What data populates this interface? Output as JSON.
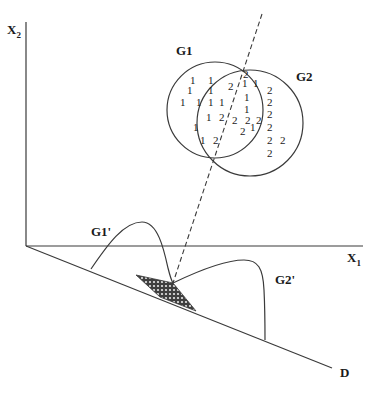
{
  "diagram": {
    "axes": {
      "x_axis": {
        "label": "X",
        "subscript": "1"
      },
      "y_axis": {
        "label": "X",
        "subscript": "2"
      },
      "projection_axis": {
        "label": "D"
      }
    },
    "groups": [
      {
        "label": "G1",
        "member_symbol": "1"
      },
      {
        "label": "G2",
        "member_symbol": "2"
      }
    ],
    "projected_distributions": [
      {
        "label": "G1'"
      },
      {
        "label": "G2'"
      }
    ],
    "points_group1": [
      {
        "x": 190,
        "y": 84,
        "t": "1"
      },
      {
        "x": 208,
        "y": 84,
        "t": "1"
      },
      {
        "x": 187,
        "y": 94,
        "t": "1"
      },
      {
        "x": 208,
        "y": 94,
        "t": "1"
      },
      {
        "x": 180,
        "y": 106,
        "t": "1"
      },
      {
        "x": 196,
        "y": 106,
        "t": "1"
      },
      {
        "x": 208,
        "y": 106,
        "t": "1"
      },
      {
        "x": 219,
        "y": 106,
        "t": "1"
      },
      {
        "x": 206,
        "y": 121,
        "t": "1"
      },
      {
        "x": 193,
        "y": 131,
        "t": "1"
      },
      {
        "x": 200,
        "y": 144,
        "t": "1"
      },
      {
        "x": 242,
        "y": 87,
        "t": "1"
      },
      {
        "x": 253,
        "y": 87,
        "t": "1"
      },
      {
        "x": 244,
        "y": 101,
        "t": "1"
      },
      {
        "x": 244,
        "y": 113,
        "t": "1"
      },
      {
        "x": 250,
        "y": 131,
        "t": "1"
      }
    ],
    "points_group2": [
      {
        "x": 243,
        "y": 78,
        "t": "2"
      },
      {
        "x": 228,
        "y": 90,
        "t": "2"
      },
      {
        "x": 219,
        "y": 121,
        "t": "2"
      },
      {
        "x": 232,
        "y": 124,
        "t": "2"
      },
      {
        "x": 245,
        "y": 124,
        "t": "2"
      },
      {
        "x": 256,
        "y": 124,
        "t": "2"
      },
      {
        "x": 240,
        "y": 135,
        "t": "2"
      },
      {
        "x": 213,
        "y": 144,
        "t": "2"
      },
      {
        "x": 267,
        "y": 94,
        "t": "2"
      },
      {
        "x": 267,
        "y": 106,
        "t": "2"
      },
      {
        "x": 267,
        "y": 118,
        "t": "2"
      },
      {
        "x": 267,
        "y": 131,
        "t": "2"
      },
      {
        "x": 267,
        "y": 144,
        "t": "2"
      },
      {
        "x": 280,
        "y": 144,
        "t": "2"
      },
      {
        "x": 267,
        "y": 157,
        "t": "2"
      }
    ],
    "colors": {
      "stroke": "#3a3a3a",
      "text": "#1a1a1a",
      "hatch": "#4a4a4a",
      "background": "#ffffff"
    }
  }
}
